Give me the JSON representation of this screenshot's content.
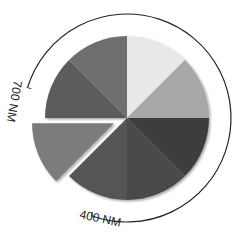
{
  "diagram": {
    "type": "spectrum-wheel",
    "center": [
      127,
      118
    ],
    "radius": 82,
    "outer_arc_radius": 104,
    "segments": [
      {
        "index": 0,
        "start_deg": 0,
        "end_deg": 45,
        "color": "#e8e8e8",
        "exploded": false
      },
      {
        "index": 1,
        "start_deg": 45,
        "end_deg": 90,
        "color": "#a8a8a8",
        "exploded": false
      },
      {
        "index": 2,
        "start_deg": 90,
        "end_deg": 135,
        "color": "#3c3c3c",
        "exploded": false
      },
      {
        "index": 3,
        "start_deg": 135,
        "end_deg": 180,
        "color": "#4a4a4a",
        "exploded": false
      },
      {
        "index": 4,
        "start_deg": 180,
        "end_deg": 225,
        "color": "#545454",
        "exploded": false
      },
      {
        "index": 5,
        "start_deg": 225,
        "end_deg": 270,
        "color": "#7c7c7c",
        "exploded": true
      },
      {
        "index": 6,
        "start_deg": 270,
        "end_deg": 315,
        "color": "#5c5c5c",
        "exploded": false
      },
      {
        "index": 7,
        "start_deg": 315,
        "end_deg": 360,
        "color": "#6e6e6e",
        "exploded": false
      }
    ],
    "labels": {
      "long_wavelength": "700 NM",
      "short_wavelength": "400 NM"
    }
  }
}
